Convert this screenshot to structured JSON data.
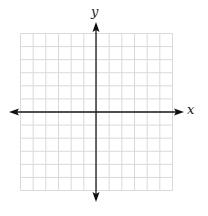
{
  "diagram": {
    "type": "coordinate-plane",
    "axes": {
      "x_label": "x",
      "y_label": "y",
      "axis_color": "#1a1a1a",
      "arrows": "both-ends"
    },
    "grid": {
      "columns": 12,
      "rows": 12,
      "columns_left_of_y_axis": 6,
      "columns_right_of_y_axis": 6,
      "rows_above_x_axis": 6,
      "rows_below_x_axis": 6,
      "line_color": "#d9d9d9",
      "tick_labels": "none"
    }
  }
}
